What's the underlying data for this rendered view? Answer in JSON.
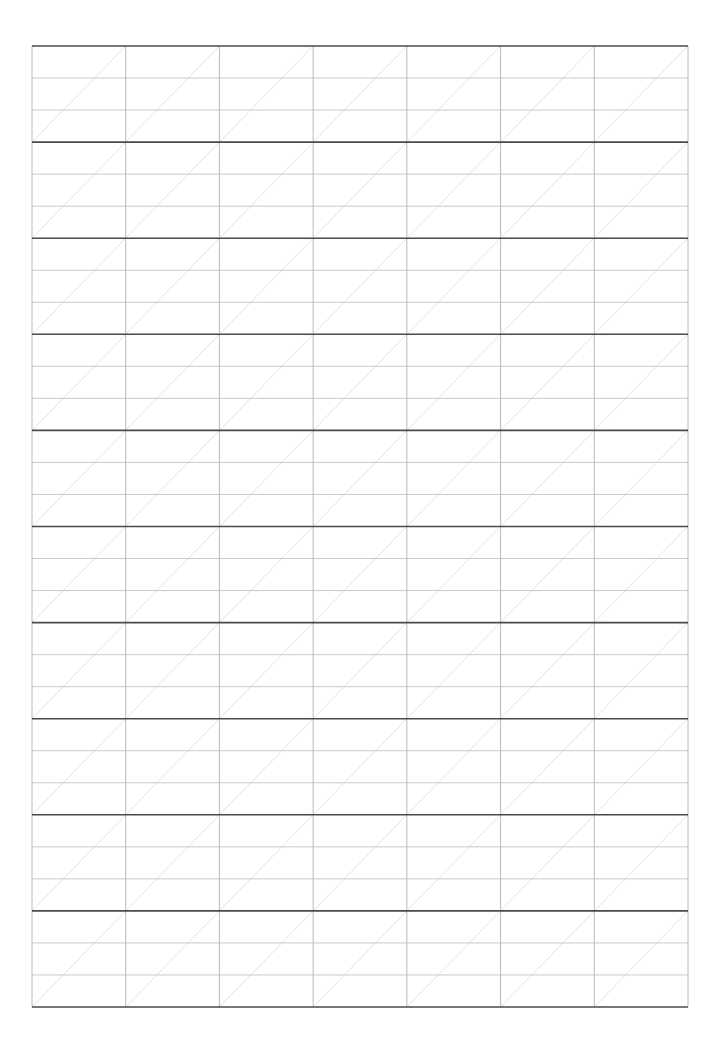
{
  "page": {
    "type": "calligraphy-practice-grid",
    "background": "#ffffff"
  },
  "grid": {
    "left": 32,
    "top": 46,
    "right": 688,
    "bottom": 1007,
    "columns": 7,
    "bands": 10,
    "sub_lines_per_band": 3,
    "colors": {
      "band_line": "#4a4a4a",
      "sub_line": "#bdbdbd",
      "column_line": "#a8a8a8",
      "diagonal": "#d6d6d6"
    },
    "stroke_widths": {
      "band_line": 1.6,
      "sub_line": 0.8,
      "column_line": 0.8,
      "diagonal": 0.7
    }
  }
}
